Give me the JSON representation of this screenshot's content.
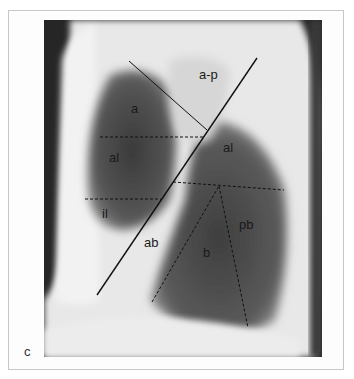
{
  "figure": {
    "panel_label": "c",
    "labels": [
      {
        "id": "a-p",
        "text": "a-p",
        "x": 199,
        "y": 74
      },
      {
        "id": "a",
        "text": "a",
        "x": 131,
        "y": 108
      },
      {
        "id": "al-left",
        "text": "al",
        "x": 109,
        "y": 157
      },
      {
        "id": "al-right",
        "text": "al",
        "x": 223,
        "y": 147
      },
      {
        "id": "il",
        "text": "il",
        "x": 102,
        "y": 213
      },
      {
        "id": "ab",
        "text": "ab",
        "x": 144,
        "y": 242
      },
      {
        "id": "pb",
        "text": "pb",
        "x": 239,
        "y": 224
      },
      {
        "id": "b",
        "text": "b",
        "x": 203,
        "y": 252
      }
    ]
  }
}
